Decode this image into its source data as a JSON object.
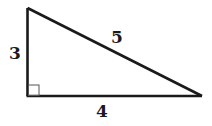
{
  "diagram": {
    "type": "right-triangle",
    "colors": {
      "stroke": "#1a1a1a",
      "background": "#ffffff",
      "marker": "#555555"
    },
    "vertices": {
      "top": [
        27,
        8
      ],
      "right_angle": [
        27,
        96
      ],
      "right": [
        202,
        96
      ]
    },
    "sides": {
      "vertical_leg": {
        "label": "3"
      },
      "horizontal_leg": {
        "label": "4"
      },
      "hypotenuse": {
        "label": "5"
      }
    },
    "right_angle_marker": true
  }
}
